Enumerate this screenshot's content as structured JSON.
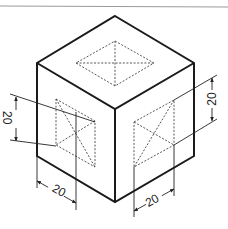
{
  "figure": {
    "type": "isometric-cube-with-dimensioned-dashed-squares",
    "colors": {
      "outline": "#1a1a1a",
      "hidden_line": "#444444",
      "dimension_line": "#222222",
      "top_rule": "#9a9a9a",
      "background": "#ffffff"
    },
    "cube": {
      "top": [
        115,
        16
      ],
      "left_top": [
        37,
        63
      ],
      "right_top": [
        194,
        63
      ],
      "center": [
        115,
        109
      ],
      "left_bottom": [
        37,
        156
      ],
      "right_bottom": [
        194,
        156
      ],
      "bottom": [
        115,
        202
      ]
    },
    "dashed_squares": {
      "top_face": [
        [
          115,
          41
        ],
        [
          154,
          63
        ],
        [
          115,
          86
        ],
        [
          76,
          63
        ]
      ],
      "left_face": [
        [
          56,
          99
        ],
        [
          95,
          121
        ],
        [
          95,
          167
        ],
        [
          56,
          145
        ]
      ],
      "right_face": [
        [
          134,
          122
        ],
        [
          174,
          100
        ],
        [
          174,
          145
        ],
        [
          134,
          167
        ]
      ]
    },
    "dimensions": [
      {
        "id": "left-vertical",
        "label": "20"
      },
      {
        "id": "left-bottom",
        "label": "20"
      },
      {
        "id": "right-vertical",
        "label": "20"
      },
      {
        "id": "right-bottom",
        "label": "20"
      }
    ]
  }
}
